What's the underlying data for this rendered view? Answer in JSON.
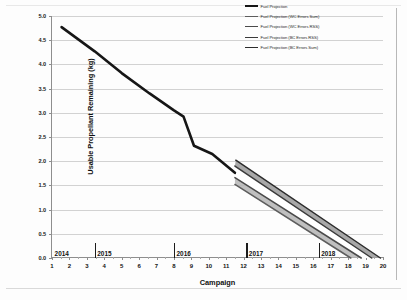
{
  "chart_data": {
    "type": "line",
    "title": "",
    "xlabel": "Campaign",
    "ylabel": "Usable Propellant Remaining (kg)",
    "xlim": [
      1,
      20
    ],
    "ylim": [
      0.0,
      5.0
    ],
    "grid": true,
    "legend_position": "top-right",
    "ytick_labels": [
      "0.0",
      "0.5",
      "1.0",
      "1.5",
      "2.0",
      "2.5",
      "3.0",
      "3.5",
      "4.0",
      "4.5",
      "5.0"
    ],
    "ytick_values": [
      0.0,
      0.5,
      1.0,
      1.5,
      2.0,
      2.5,
      3.0,
      3.5,
      4.0,
      4.5,
      5.0
    ],
    "xtick_labels": [
      "1",
      "2",
      "3",
      "4",
      "5",
      "6",
      "7",
      "8",
      "9",
      "10",
      "11",
      "12",
      "13",
      "14",
      "15",
      "16",
      "17",
      "18",
      "19",
      "20"
    ],
    "xtick_values": [
      1,
      2,
      3,
      4,
      5,
      6,
      7,
      8,
      9,
      10,
      11,
      12,
      13,
      14,
      15,
      16,
      17,
      18,
      19,
      20
    ],
    "year_markers": [
      {
        "label": "2014",
        "boundary_x": 1.0,
        "label_x": 1.15
      },
      {
        "label": "2015",
        "boundary_x": 3.45,
        "label_x": 3.6
      },
      {
        "label": "2016",
        "boundary_x": 8.0,
        "label_x": 8.15
      },
      {
        "label": "2017",
        "boundary_x": 12.15,
        "label_x": 12.3
      },
      {
        "label": "2018",
        "boundary_x": 16.3,
        "label_x": 16.45
      }
    ],
    "series": [
      {
        "name": "Fuel Projection",
        "color": "#161616",
        "width": 2.6,
        "dash": "none",
        "points": [
          {
            "x": 1.55,
            "y": 4.77
          },
          {
            "x": 3.45,
            "y": 4.27
          },
          {
            "x": 5.0,
            "y": 3.82
          },
          {
            "x": 6.6,
            "y": 3.4
          },
          {
            "x": 8.0,
            "y": 3.05
          },
          {
            "x": 8.55,
            "y": 2.92
          },
          {
            "x": 9.15,
            "y": 2.32
          },
          {
            "x": 10.2,
            "y": 2.15
          },
          {
            "x": 11.5,
            "y": 1.76
          }
        ]
      },
      {
        "name": "Fuel Projection (WC Errors Sum)",
        "color": "#5d5d5d",
        "width": 1.5,
        "dash": "none",
        "points": [
          {
            "x": 11.5,
            "y": 1.52
          },
          {
            "x": 18.15,
            "y": 0.0
          }
        ]
      },
      {
        "name": "Fuel Projection (WC Errors RSS)",
        "color": "#4a4a4a",
        "width": 1.5,
        "dash": "none",
        "points": [
          {
            "x": 11.5,
            "y": 1.66
          },
          {
            "x": 18.75,
            "y": 0.0
          }
        ]
      },
      {
        "name": "Fuel Projection (BC Errors RSS)",
        "color": "#3a3a3a",
        "width": 1.5,
        "dash": "none",
        "points": [
          {
            "x": 11.5,
            "y": 1.9
          },
          {
            "x": 19.35,
            "y": 0.0
          }
        ]
      },
      {
        "name": "Fuel Projection (BC Errors Sum)",
        "color": "#2c2c2c",
        "width": 1.5,
        "dash": "none",
        "points": [
          {
            "x": 11.55,
            "y": 2.02
          },
          {
            "x": 19.85,
            "y": 0.0
          }
        ]
      }
    ],
    "bands": [
      {
        "name": "wc-sum-to-wc-rss",
        "color": "#b4b4b4",
        "opacity": 0.85,
        "upper": [
          {
            "x": 11.5,
            "y": 1.66
          },
          {
            "x": 18.75,
            "y": 0.0
          }
        ],
        "lower": [
          {
            "x": 11.5,
            "y": 1.52
          },
          {
            "x": 18.15,
            "y": 0.0
          }
        ]
      },
      {
        "name": "wc-rss-to-bc-rss",
        "color": "#ffffff",
        "opacity": 1.0,
        "upper": [
          {
            "x": 11.5,
            "y": 1.9
          },
          {
            "x": 19.35,
            "y": 0.0
          }
        ],
        "lower": [
          {
            "x": 11.5,
            "y": 1.66
          },
          {
            "x": 18.75,
            "y": 0.0
          }
        ]
      },
      {
        "name": "bc-rss-to-bc-sum",
        "color": "#9e9e9e",
        "opacity": 0.9,
        "upper": [
          {
            "x": 11.55,
            "y": 2.02
          },
          {
            "x": 19.85,
            "y": 0.0
          }
        ],
        "lower": [
          {
            "x": 11.5,
            "y": 1.9
          },
          {
            "x": 19.35,
            "y": 0.0
          }
        ]
      }
    ]
  }
}
